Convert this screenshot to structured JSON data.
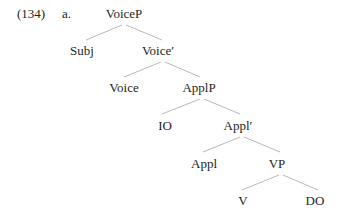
{
  "example": {
    "number": "(134)",
    "sub_label": "a."
  },
  "tree": {
    "nodes": [
      {
        "id": "voiceP",
        "label": "VoiceP",
        "x": 124,
        "y": 14
      },
      {
        "id": "subj",
        "label": "Subj",
        "x": 82,
        "y": 51
      },
      {
        "id": "voice_bar",
        "label": "Voice′",
        "x": 158,
        "y": 51
      },
      {
        "id": "voice",
        "label": "Voice",
        "x": 124,
        "y": 88
      },
      {
        "id": "applP",
        "label": "ApplP",
        "x": 199,
        "y": 88
      },
      {
        "id": "io",
        "label": "IO",
        "x": 165,
        "y": 126
      },
      {
        "id": "appl_bar",
        "label": "Appl′",
        "x": 238,
        "y": 126
      },
      {
        "id": "appl",
        "label": "Appl",
        "x": 204,
        "y": 164
      },
      {
        "id": "vp",
        "label": "VP",
        "x": 277,
        "y": 164
      },
      {
        "id": "v",
        "label": "V",
        "x": 243,
        "y": 201
      },
      {
        "id": "do",
        "label": "DO",
        "x": 315,
        "y": 201
      }
    ],
    "edges": [
      [
        "voiceP",
        "subj"
      ],
      [
        "voiceP",
        "voice_bar"
      ],
      [
        "voice_bar",
        "voice"
      ],
      [
        "voice_bar",
        "applP"
      ],
      [
        "applP",
        "io"
      ],
      [
        "applP",
        "appl_bar"
      ],
      [
        "appl_bar",
        "appl"
      ],
      [
        "appl_bar",
        "vp"
      ],
      [
        "vp",
        "v"
      ],
      [
        "vp",
        "do"
      ]
    ]
  }
}
